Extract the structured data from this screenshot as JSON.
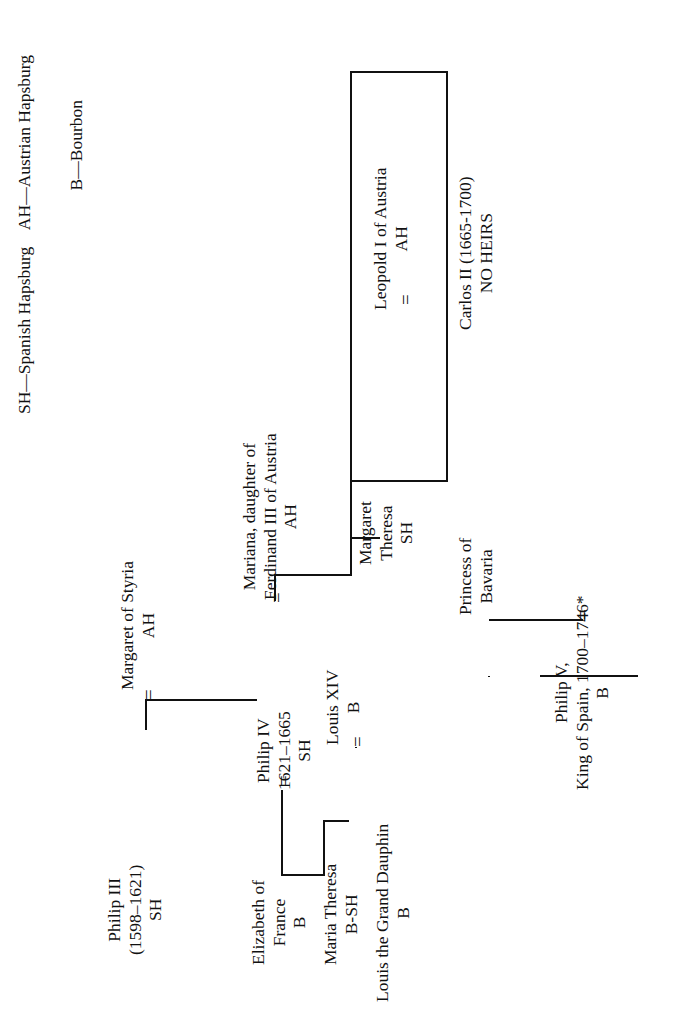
{
  "document": {
    "type": "genealogical-family-tree",
    "orientation": "rotated-90-counterclockwise",
    "background_color": "#ffffff",
    "text_color": "#111111"
  },
  "legend": {
    "line1": "SH—Spanish Hapsburg    AH—Austrian Hapsburg",
    "line2": "B—Bourbon",
    "entries": [
      {
        "code": "SH",
        "meaning": "Spanish Hapsburg"
      },
      {
        "code": "AH",
        "meaning": "Austrian Hapsburg"
      },
      {
        "code": "B",
        "meaning": "Bourbon"
      }
    ]
  },
  "marriage_symbol": "=",
  "nodes": {
    "philip_iii": {
      "name": "Philip III",
      "dates": "(1598–1621)",
      "house": "SH",
      "text": "Philip III\n(1598–1621)\nSH"
    },
    "margaret_of_styria": {
      "name": "Margaret of Styria",
      "house": "AH",
      "text": "Margaret of Styria\nAH"
    },
    "philip_iv": {
      "name": "Philip IV",
      "dates": "1621–1665",
      "house": "SH",
      "text": "Philip IV\n1621–1665\nSH"
    },
    "elizabeth_of_france": {
      "name": "Elizabeth of\nFrance",
      "house": "B",
      "text": "Elizabeth of\nFrance\nB"
    },
    "mariana": {
      "name": "Mariana, daughter of\nFerdinand III of Austria",
      "house": "AH",
      "text": "Mariana, daughter of\nFerdinand III of Austria\nAH"
    },
    "maria_theresa": {
      "name": "Maria Theresa",
      "house": "B-SH",
      "text": "Maria Theresa\nB-SH"
    },
    "louis_xiv": {
      "name": "Louis XIV",
      "house": "B",
      "text": "Louis XIV\nB"
    },
    "louis_grand_dauphin": {
      "name": "Louis the Grand Dauphin",
      "house": "B",
      "text": "Louis the Grand Dauphin\nB"
    },
    "margaret_theresa": {
      "name": "Margaret\nTheresa",
      "house": "SH",
      "text": "Margaret\nTheresa\nSH"
    },
    "leopold_i": {
      "name": "Leopold I of Austria",
      "house": "AH",
      "text": "Leopold I of Austria\nAH"
    },
    "carlos_ii": {
      "name": "Carlos II (1665-1700)",
      "note": "NO HEIRS",
      "text": "Carlos II (1665-1700)\nNO HEIRS"
    },
    "princess_of_bavaria": {
      "name": "Princess of\nBavaria",
      "text": "Princess of\nBavaria"
    },
    "philip_v": {
      "name": "Philip V,",
      "title": "King of Spain, 1700–1746*",
      "house": "B",
      "text": "Philip V,\nKing of Spain, 1700–1746*\nB"
    }
  }
}
